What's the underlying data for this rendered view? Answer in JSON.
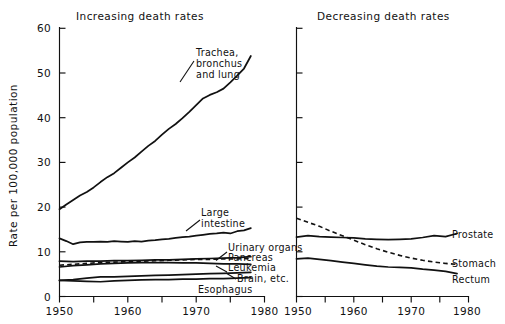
{
  "figure": {
    "ylabel": "Rate per 100,000 population",
    "panels": [
      {
        "id": "left",
        "title": "Increasing death rates"
      },
      {
        "id": "right",
        "title": "Decreasing death rates"
      }
    ]
  },
  "chart_data": {
    "type": "line",
    "xlabel": "",
    "ylabel": "Rate per 100,000 population",
    "xlim": [
      1950,
      1980
    ],
    "ylim": [
      0,
      60
    ],
    "grid": false,
    "legend_position": "inline-right-of-line",
    "y_ticks": [
      0,
      10,
      20,
      30,
      40,
      50,
      60
    ],
    "y_tick_labels": [
      "0",
      "10",
      "20",
      "30",
      "40",
      "50",
      "60"
    ],
    "x_ticks": [
      1950,
      1955,
      1960,
      1965,
      1970,
      1975,
      1980
    ],
    "x_tick_labels": [
      "1950",
      "",
      "1960",
      "",
      "1970",
      "",
      "1980"
    ],
    "panels": [
      {
        "name": "Increasing death rates",
        "title": "Increasing death rates",
        "series": [
          {
            "name": "Trachea, bronchus and lung",
            "label": "Trachea,\nbronchus\nand lung",
            "style": "solid",
            "x": [
              1950,
              1951,
              1952,
              1953,
              1954,
              1955,
              1956,
              1957,
              1958,
              1959,
              1960,
              1961,
              1962,
              1963,
              1964,
              1965,
              1966,
              1967,
              1968,
              1969,
              1970,
              1971,
              1972,
              1973,
              1974,
              1975,
              1976,
              1977,
              1978
            ],
            "values": [
              19.5,
              20.6,
              21.6,
              22.6,
              23.4,
              24.4,
              25.6,
              26.7,
              27.6,
              28.8,
              30.0,
              31.1,
              32.4,
              33.7,
              34.8,
              36.2,
              37.5,
              38.6,
              39.9,
              41.3,
              42.8,
              44.3,
              45.1,
              45.7,
              46.5,
              47.9,
              49.4,
              51.0,
              53.8
            ]
          },
          {
            "name": "Large intestine",
            "label": "Large\nintestine",
            "style": "solid",
            "x": [
              1950,
              1951,
              1952,
              1953,
              1954,
              1955,
              1956,
              1957,
              1958,
              1959,
              1960,
              1961,
              1962,
              1963,
              1964,
              1965,
              1966,
              1967,
              1968,
              1969,
              1970,
              1971,
              1972,
              1973,
              1974,
              1975,
              1976,
              1977,
              1978
            ],
            "values": [
              13.0,
              12.4,
              11.7,
              12.1,
              12.2,
              12.2,
              12.3,
              12.2,
              12.4,
              12.3,
              12.2,
              12.4,
              12.3,
              12.5,
              12.6,
              12.8,
              12.9,
              13.1,
              13.3,
              13.4,
              13.6,
              13.8,
              14.0,
              14.1,
              14.3,
              14.1,
              14.6,
              14.8,
              15.3
            ]
          },
          {
            "name": "Urinary organs",
            "label": "Urinary organs",
            "style": "solid",
            "x": [
              1950,
              1952,
              1954,
              1956,
              1958,
              1960,
              1962,
              1964,
              1966,
              1968,
              1970,
              1972,
              1974,
              1976,
              1978
            ],
            "values": [
              7.9,
              7.8,
              7.9,
              7.9,
              8.0,
              8.0,
              8.1,
              8.2,
              8.2,
              8.3,
              8.4,
              8.5,
              8.6,
              8.7,
              8.9
            ]
          },
          {
            "name": "Pancreas",
            "label": "Pancreas",
            "style": "dashed",
            "x": [
              1950,
              1952,
              1954,
              1956,
              1958,
              1960,
              1962,
              1964,
              1966,
              1968,
              1970,
              1972,
              1974,
              1976,
              1978
            ],
            "values": [
              7.0,
              7.2,
              7.4,
              7.6,
              7.7,
              7.8,
              7.9,
              8.0,
              8.1,
              8.2,
              8.3,
              8.3,
              8.4,
              8.4,
              8.5
            ]
          },
          {
            "name": "Leukemia",
            "label": "Leukemia",
            "style": "solid",
            "x": [
              1950,
              1952,
              1954,
              1956,
              1958,
              1960,
              1962,
              1964,
              1966,
              1968,
              1970,
              1972,
              1974,
              1976,
              1978
            ],
            "values": [
              6.6,
              6.9,
              7.1,
              7.3,
              7.4,
              7.5,
              7.6,
              7.6,
              7.6,
              7.5,
              7.5,
              7.4,
              7.3,
              7.3,
              7.2
            ]
          },
          {
            "name": "Brain, etc.",
            "label": "Brain, etc.",
            "style": "solid",
            "x": [
              1950,
              1952,
              1954,
              1956,
              1958,
              1960,
              1962,
              1964,
              1966,
              1968,
              1970,
              1972,
              1974,
              1976,
              1978
            ],
            "values": [
              3.6,
              3.8,
              4.1,
              4.4,
              4.4,
              4.5,
              4.6,
              4.7,
              4.8,
              4.9,
              5.0,
              5.1,
              5.2,
              5.3,
              5.4
            ]
          },
          {
            "name": "Esophagus",
            "label": "Esophagus",
            "style": "solid",
            "x": [
              1950,
              1952,
              1954,
              1956,
              1958,
              1960,
              1962,
              1964,
              1966,
              1968,
              1970,
              1972,
              1974,
              1976,
              1978
            ],
            "values": [
              3.6,
              3.5,
              3.4,
              3.3,
              3.5,
              3.6,
              3.7,
              3.8,
              3.8,
              3.9,
              3.9,
              4.0,
              4.0,
              4.1,
              4.2
            ]
          }
        ]
      },
      {
        "name": "Decreasing death rates",
        "title": "Decreasing death rates",
        "series": [
          {
            "name": "Prostate",
            "label": "Prostate",
            "style": "solid",
            "x": [
              1950,
              1952,
              1954,
              1956,
              1958,
              1960,
              1962,
              1964,
              1966,
              1968,
              1970,
              1972,
              1974,
              1976,
              1978
            ],
            "values": [
              13.3,
              13.6,
              13.4,
              13.3,
              13.2,
              13.1,
              12.9,
              12.8,
              12.7,
              12.8,
              12.9,
              13.2,
              13.6,
              13.4,
              14.1
            ]
          },
          {
            "name": "Stomach",
            "label": "Stomach",
            "style": "dashed",
            "x": [
              1950,
              1952,
              1954,
              1956,
              1958,
              1960,
              1962,
              1964,
              1966,
              1968,
              1970,
              1972,
              1974,
              1976,
              1978
            ],
            "values": [
              17.5,
              16.6,
              15.7,
              14.6,
              13.6,
              12.6,
              11.6,
              10.7,
              9.9,
              9.2,
              8.6,
              8.1,
              7.7,
              7.4,
              7.2
            ]
          },
          {
            "name": "Rectum",
            "label": "Rectum",
            "style": "solid",
            "x": [
              1950,
              1952,
              1954,
              1956,
              1958,
              1960,
              1962,
              1964,
              1966,
              1968,
              1970,
              1972,
              1974,
              1976,
              1978
            ],
            "values": [
              8.4,
              8.6,
              8.3,
              8.0,
              7.7,
              7.4,
              7.1,
              6.8,
              6.6,
              6.5,
              6.4,
              6.1,
              5.9,
              5.6,
              5.1
            ]
          }
        ]
      }
    ]
  }
}
